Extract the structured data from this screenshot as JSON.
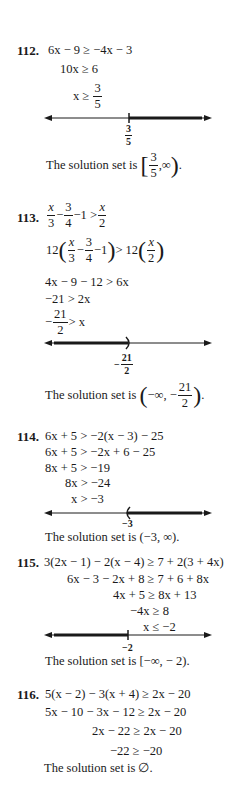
{
  "problems": [
    {
      "number": "112.",
      "steps": [
        "6x − 9 ≥ −4x − 3",
        "10x ≥ 6",
        "x ≥"
      ],
      "step3_frac": {
        "num": "3",
        "den": "5"
      },
      "number_line": {
        "point_label_num": "3",
        "point_label_den": "5",
        "point": 0.6,
        "direction": "right",
        "endpoint": "closed"
      },
      "solution_prefix": "The solution set is",
      "solution": {
        "open": "[",
        "num": "3",
        "den": "5",
        "rest": ",∞",
        "close": ")",
        "end": "."
      }
    },
    {
      "number": "113.",
      "step1": {
        "a_num": "x",
        "a_den": "3",
        "minus": "−",
        "b_num": "3",
        "b_den": "4",
        "tail": "−1 >",
        "c_num": "x",
        "c_den": "2"
      },
      "step2": {
        "lead": "12",
        "a_num": "x",
        "a_den": "3",
        "minus": "−",
        "b_num": "3",
        "b_den": "4",
        "tail": "−1",
        "mid": "> 12",
        "c_num": "x",
        "c_den": "2"
      },
      "steps": [
        "4x − 9 − 12 > 6x",
        "−21 > 2x"
      ],
      "step5": {
        "minus": "−",
        "num": "21",
        "den": "2",
        "rest": "> x"
      },
      "number_line": {
        "point_label_prefix": "−",
        "point_label_num": "21",
        "point_label_den": "2",
        "point": -10.5,
        "direction": "left",
        "endpoint": "open"
      },
      "solution_prefix": "The solution set is",
      "solution": {
        "open": "(",
        "lead": "−∞, −",
        "num": "21",
        "den": "2",
        "close": ")",
        "end": "."
      }
    },
    {
      "number": "114.",
      "steps": [
        "6x + 5 > −2(x − 3) − 25",
        "6x + 5 > −2x + 6 − 25",
        "8x + 5 > −19",
        "8x > −24",
        "x > −3"
      ],
      "number_line": {
        "point_label": "−3",
        "point": -3,
        "direction": "right",
        "endpoint": "open"
      },
      "solution_prefix": "The solution set is",
      "solution_value": "(−3, ∞)."
    },
    {
      "number": "115.",
      "steps": [
        "3(2x − 1) − 2(x − 4) ≥ 7 + 2(3 + 4x)",
        "6x − 3 − 2x + 8 ≥ 7 + 6 + 8x",
        "4x + 5 ≥ 8x + 13",
        "−4x ≥ 8",
        "x ≤ −2"
      ],
      "number_line": {
        "point_label": "−2",
        "point": -2,
        "direction": "left",
        "endpoint": "closed"
      },
      "solution_prefix": "The solution set is",
      "solution_value": "[−∞, − 2)."
    },
    {
      "number": "116.",
      "steps": [
        "5(x − 2) − 3(x + 4) ≥ 2x − 20",
        "5x − 10 − 3x − 12 ≥ 2x − 20",
        "2x − 22 ≥ 2x − 20",
        "−22 ≥ −20"
      ],
      "solution_prefix": "The solution set is",
      "solution_value": "∅."
    }
  ]
}
